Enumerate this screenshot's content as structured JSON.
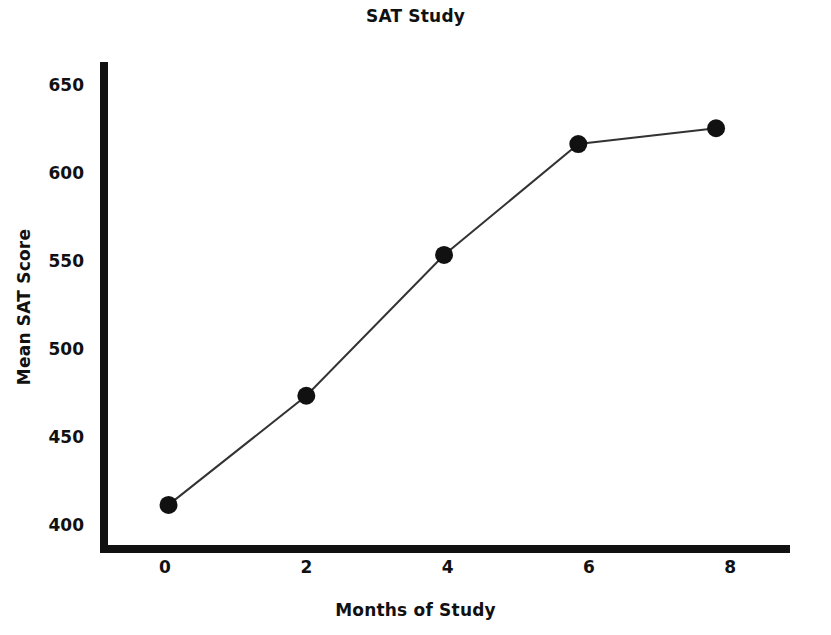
{
  "chart_data": {
    "type": "line",
    "title": "SAT Study",
    "xlabel": "Months of Study",
    "ylabel": "Mean SAT Score",
    "x": [
      0.05,
      2.0,
      3.95,
      5.85,
      7.8
    ],
    "values": [
      412,
      474,
      554,
      617,
      626
    ],
    "series": [
      {
        "name": "Mean SAT Score",
        "points": [
          {
            "x": 0.05,
            "y": 412
          },
          {
            "x": 2.0,
            "y": 474
          },
          {
            "x": 3.95,
            "y": 554
          },
          {
            "x": 5.85,
            "y": 617
          },
          {
            "x": 7.8,
            "y": 626
          }
        ]
      }
    ],
    "xlim": [
      -0.85,
      8.85
    ],
    "ylim": [
      393,
      672
    ],
    "xticks": [
      0,
      2,
      4,
      6,
      8
    ],
    "yticks": [
      400,
      450,
      500,
      550,
      600,
      650
    ],
    "xtick_labels": [
      "0",
      "2",
      "4",
      "6",
      "8"
    ],
    "ytick_labels": [
      "400",
      "450",
      "500",
      "550",
      "600",
      "650"
    ],
    "grid": false,
    "legend": "none",
    "marker": "circle",
    "marker_color": "#111111",
    "line_color": "#333333"
  },
  "axis_labels": {
    "y": [
      {
        "value": 650,
        "text": "650"
      },
      {
        "value": 600,
        "text": "600"
      },
      {
        "value": 550,
        "text": "550"
      },
      {
        "value": 500,
        "text": "500"
      },
      {
        "value": 450,
        "text": "450"
      },
      {
        "value": 400,
        "text": "400"
      }
    ],
    "x": [
      {
        "value": 0,
        "text": "0"
      },
      {
        "value": 2,
        "text": "2"
      },
      {
        "value": 4,
        "text": "4"
      },
      {
        "value": 6,
        "text": "6"
      },
      {
        "value": 8,
        "text": "8"
      }
    ]
  }
}
